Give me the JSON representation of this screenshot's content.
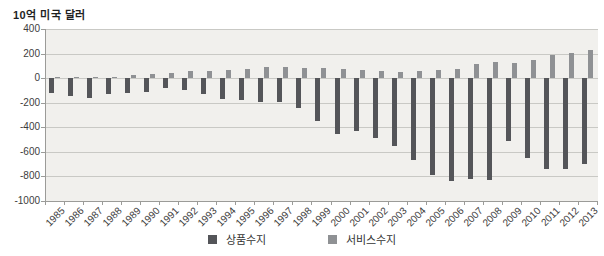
{
  "chart_data": {
    "type": "bar",
    "title": "10억 미국 달러",
    "categories": [
      "1985",
      "1986",
      "1987",
      "1988",
      "1989",
      "1990",
      "1991",
      "1992",
      "1993",
      "1994",
      "1995",
      "1996",
      "1997",
      "1998",
      "1999",
      "2000",
      "2001",
      "2002",
      "2003",
      "2004",
      "2005",
      "2006",
      "2007",
      "2008",
      "2009",
      "2010",
      "2011",
      "2012",
      "2013"
    ],
    "series": [
      {
        "name": "상품수지",
        "color": "#545559",
        "values": [
          -122.2,
          -145.1,
          -159.6,
          -127.0,
          -117.7,
          -111.0,
          -76.9,
          -96.9,
          -132.5,
          -166.2,
          -174.2,
          -191.3,
          -198.1,
          -246.7,
          -346.0,
          -454.7,
          -429.5,
          -485.0,
          -550.9,
          -669.6,
          -790.9,
          -838.3,
          -821.2,
          -832.5,
          -509.7,
          -648.7,
          -740.6,
          -741.1,
          -702.6
        ]
      },
      {
        "name": "서비스수지",
        "color": "#8f9194",
        "values": [
          0.3,
          6.3,
          7.9,
          12.2,
          24.0,
          30.2,
          45.8,
          57.7,
          61.8,
          67.3,
          77.8,
          86.9,
          89.9,
          82.1,
          82.7,
          74.9,
          64.4,
          61.2,
          52.4,
          54.1,
          68.6,
          75.6,
          115.1,
          131.8,
          125.9,
          150.4,
          187.3,
          204.5,
          225.3
        ]
      }
    ],
    "xlabel": "",
    "ylabel": "10억 미국 달러",
    "ylim": [
      -1000,
      400
    ],
    "yticks": [
      400,
      200,
      0,
      -200,
      -400,
      -600,
      -800,
      -1000
    ],
    "grid": true,
    "legend_position": "bottom",
    "plot_background_color": "#f1f0ed",
    "gridline_color": "#c9c9c5",
    "axis_color": "#9b9b98"
  }
}
